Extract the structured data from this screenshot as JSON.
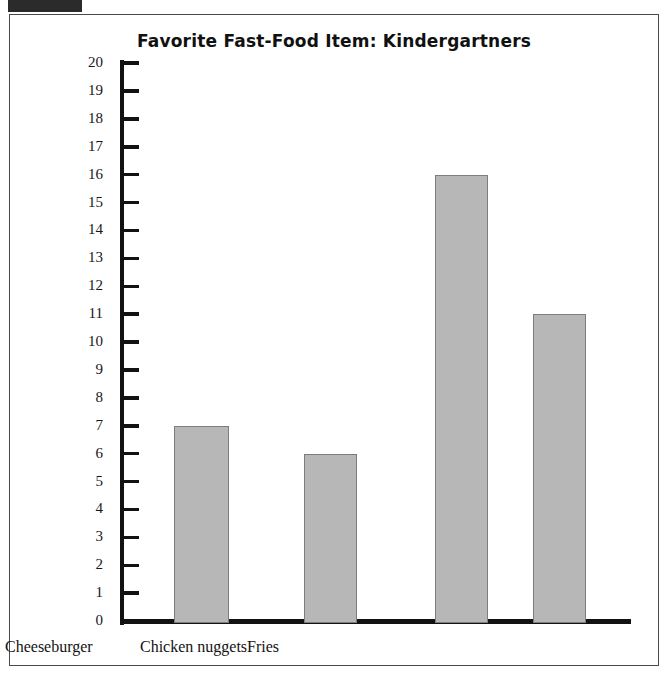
{
  "figure": {
    "title": "Favorite Fast-Food Item: Kindergartners",
    "corner_tab_label": ""
  },
  "chart_data": {
    "type": "bar",
    "title": "Favorite Fast-Food Item: Kindergartners",
    "xlabel": "",
    "ylabel": "",
    "categories": [
      "Hamburger",
      "Cheeseburger",
      "Chicken nuggets",
      "Fries"
    ],
    "values": [
      7,
      6,
      16,
      11
    ],
    "ylim": [
      0,
      20
    ],
    "ytick_labels": [
      "20",
      "19",
      "18",
      "17",
      "16",
      "15",
      "14",
      "13",
      "12",
      "11",
      "10",
      "9",
      "8",
      "7",
      "6",
      "5",
      "4",
      "3",
      "2",
      "1",
      "0"
    ],
    "ytick_values": [
      20,
      19,
      18,
      17,
      16,
      15,
      14,
      13,
      12,
      11,
      10,
      9,
      8,
      7,
      6,
      5,
      4,
      3,
      2,
      1,
      0
    ],
    "grid": false,
    "legend": null,
    "bar_fill_color": "#b7b7b7",
    "bar_edge_color": "#7d7d7d",
    "axis_color": "#121212"
  }
}
